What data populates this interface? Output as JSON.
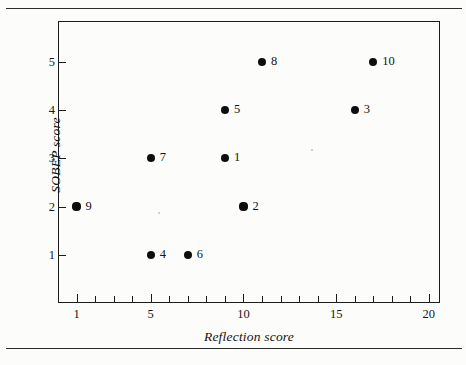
{
  "figure": {
    "background_color": "#fcfcfa",
    "ink_color": "#111111",
    "has_top_rule": true,
    "has_bottom_rule": true
  },
  "chart_data": {
    "type": "scatter",
    "title": "",
    "xlabel": "Reflection score",
    "ylabel": "SOBEP score",
    "xlim": [
      0,
      20.6
    ],
    "ylim": [
      0,
      5.85
    ],
    "grid": false,
    "legend": null,
    "x_ticks_major": [
      1,
      5,
      10,
      15,
      20
    ],
    "x_tick_labels": [
      "1",
      "5",
      "10",
      "15",
      "20"
    ],
    "x_ticks_all": [
      1,
      2,
      3,
      4,
      5,
      6,
      7,
      8,
      9,
      10,
      11,
      12,
      13,
      14,
      15,
      16,
      17,
      18,
      19,
      20
    ],
    "y_ticks": [
      1,
      2,
      3,
      4,
      5
    ],
    "y_tick_labels": [
      "1",
      "2",
      "3",
      "4",
      "5"
    ],
    "point_labels_position": "right",
    "marker": "filled-circle",
    "marker_color": "#0d0d0d",
    "points": [
      {
        "label": "9",
        "x": 1,
        "y": 2
      },
      {
        "label": "4",
        "x": 5,
        "y": 1
      },
      {
        "label": "7",
        "x": 5,
        "y": 3
      },
      {
        "label": "6",
        "x": 7,
        "y": 1
      },
      {
        "label": "1",
        "x": 9,
        "y": 3
      },
      {
        "label": "5",
        "x": 9,
        "y": 4
      },
      {
        "label": "2",
        "x": 10,
        "y": 2
      },
      {
        "label": "8",
        "x": 11,
        "y": 5
      },
      {
        "label": "3",
        "x": 16,
        "y": 4
      },
      {
        "label": "10",
        "x": 17,
        "y": 5
      }
    ]
  }
}
